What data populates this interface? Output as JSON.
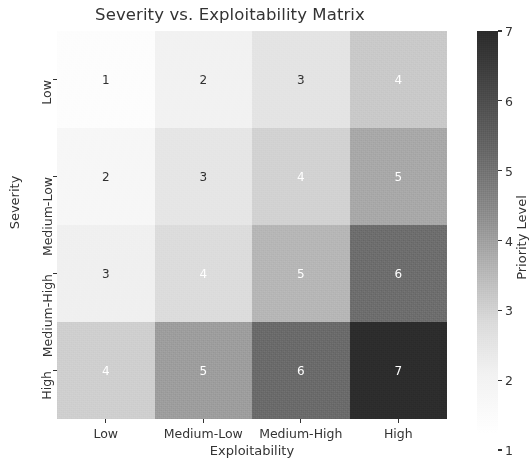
{
  "chart_data": {
    "type": "heatmap",
    "title": "Severity vs. Exploitability Matrix",
    "xlabel": "Exploitability",
    "ylabel": "Severity",
    "x_categories": [
      "Low",
      "Medium-Low",
      "Medium-High",
      "High"
    ],
    "y_categories": [
      "Low",
      "Medium-Low",
      "Medium-High",
      "High"
    ],
    "values": [
      [
        1,
        2,
        3,
        4
      ],
      [
        2,
        3,
        4,
        5
      ],
      [
        3,
        4,
        5,
        6
      ],
      [
        4,
        5,
        6,
        7
      ]
    ],
    "cell_colors": [
      [
        "#fdfdfd",
        "#f2f2f2",
        "#e4e4e4",
        "#c9c9c9"
      ],
      [
        "#f7f7f7",
        "#e6e6e6",
        "#d2d2d2",
        "#a8a8a8"
      ],
      [
        "#f0f0f0",
        "#dcdcdc",
        "#b6b6b6",
        "#6d6d6d"
      ],
      [
        "#cfcfcf",
        "#9d9d9d",
        "#6a6a6a",
        "#2c2c2c"
      ]
    ],
    "cell_text_colors": [
      [
        "#303030",
        "#303030",
        "#303030",
        "#ffffff"
      ],
      [
        "#303030",
        "#303030",
        "#ffffff",
        "#ffffff"
      ],
      [
        "#303030",
        "#ffffff",
        "#ffffff",
        "#ffffff"
      ],
      [
        "#ffffff",
        "#ffffff",
        "#ffffff",
        "#ffffff"
      ]
    ],
    "colorbar": {
      "label": "Priority Level",
      "ticks": [
        7,
        6,
        5,
        4,
        3,
        2,
        1
      ],
      "vmin": 1,
      "vmax": 7,
      "colormap": "gray_r",
      "position": "right"
    },
    "grid": false,
    "legend": "colorbar-right"
  }
}
